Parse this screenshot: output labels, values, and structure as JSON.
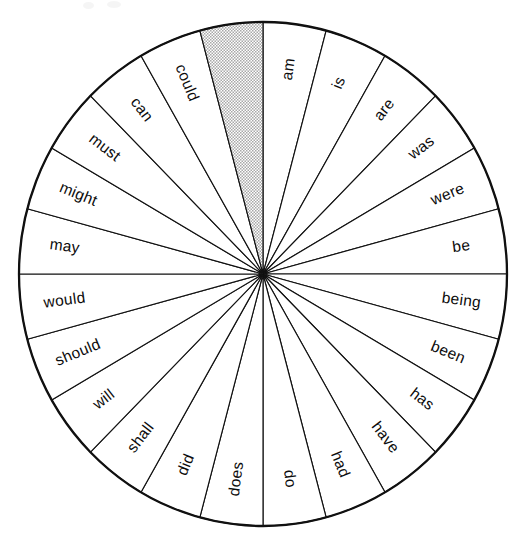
{
  "figure": {
    "type": "radial-sector-wheel",
    "sector_count": 24,
    "sector_degrees": 15,
    "center": {
      "x": 263,
      "y": 274
    },
    "radius_x": 244,
    "radius_y": 252,
    "colors": {
      "outline": "#101010",
      "sector_fill": "#ffffff",
      "shaded_fill": "#cfcfcf",
      "background": "#ffffff",
      "text": "#0c0c0c"
    },
    "label_radius_fraction": 0.82
  },
  "chart_data": {
    "type": "pie",
    "xlabel": "",
    "ylabel": "",
    "legend_position": "none",
    "grid": false,
    "equal_slices": true,
    "slice_degrees": 15,
    "start_angle_deg": -90,
    "direction": "clockwise",
    "categories": [
      "am",
      "is",
      "are",
      "was",
      "were",
      "be",
      "being",
      "been",
      "has",
      "have",
      "had",
      "do",
      "does",
      "did",
      "shall",
      "will",
      "should",
      "would",
      "may",
      "might",
      "must",
      "can",
      "could",
      ""
    ],
    "values": [
      15,
      15,
      15,
      15,
      15,
      15,
      15,
      15,
      15,
      15,
      15,
      15,
      15,
      15,
      15,
      15,
      15,
      15,
      15,
      15,
      15,
      15,
      15,
      15
    ],
    "shaded_indices": [
      23
    ],
    "annotations": [
      "One sector is left blank and shaded gray, immediately counter-clockwise of the 12 o'clock position."
    ]
  },
  "wheel": {
    "sectors": [
      {
        "index": 0,
        "label": "am",
        "start_deg": -90,
        "end_deg": -75,
        "shaded": false
      },
      {
        "index": 1,
        "label": "is",
        "start_deg": -75,
        "end_deg": -60,
        "shaded": false
      },
      {
        "index": 2,
        "label": "are",
        "start_deg": -60,
        "end_deg": -45,
        "shaded": false
      },
      {
        "index": 3,
        "label": "was",
        "start_deg": -45,
        "end_deg": -30,
        "shaded": false
      },
      {
        "index": 4,
        "label": "were",
        "start_deg": -30,
        "end_deg": -15,
        "shaded": false
      },
      {
        "index": 5,
        "label": "be",
        "start_deg": -15,
        "end_deg": 0,
        "shaded": false
      },
      {
        "index": 6,
        "label": "being",
        "start_deg": 0,
        "end_deg": 15,
        "shaded": false
      },
      {
        "index": 7,
        "label": "been",
        "start_deg": 15,
        "end_deg": 30,
        "shaded": false
      },
      {
        "index": 8,
        "label": "has",
        "start_deg": 30,
        "end_deg": 45,
        "shaded": false
      },
      {
        "index": 9,
        "label": "have",
        "start_deg": 45,
        "end_deg": 60,
        "shaded": false
      },
      {
        "index": 10,
        "label": "had",
        "start_deg": 60,
        "end_deg": 75,
        "shaded": false
      },
      {
        "index": 11,
        "label": "do",
        "start_deg": 75,
        "end_deg": 90,
        "shaded": false
      },
      {
        "index": 12,
        "label": "does",
        "start_deg": 90,
        "end_deg": 105,
        "shaded": false
      },
      {
        "index": 13,
        "label": "did",
        "start_deg": 105,
        "end_deg": 120,
        "shaded": false
      },
      {
        "index": 14,
        "label": "shall",
        "start_deg": 120,
        "end_deg": 135,
        "shaded": false
      },
      {
        "index": 15,
        "label": "will",
        "start_deg": 135,
        "end_deg": 150,
        "shaded": false
      },
      {
        "index": 16,
        "label": "should",
        "start_deg": 150,
        "end_deg": 165,
        "shaded": false
      },
      {
        "index": 17,
        "label": "would",
        "start_deg": 165,
        "end_deg": 180,
        "shaded": false
      },
      {
        "index": 18,
        "label": "may",
        "start_deg": 180,
        "end_deg": 195,
        "shaded": false
      },
      {
        "index": 19,
        "label": "might",
        "start_deg": 195,
        "end_deg": 210,
        "shaded": false
      },
      {
        "index": 20,
        "label": "must",
        "start_deg": 210,
        "end_deg": 225,
        "shaded": false
      },
      {
        "index": 21,
        "label": "can",
        "start_deg": 225,
        "end_deg": 240,
        "shaded": false
      },
      {
        "index": 22,
        "label": "could",
        "start_deg": 240,
        "end_deg": 255,
        "shaded": false
      },
      {
        "index": 23,
        "label": "",
        "start_deg": 255,
        "end_deg": 270,
        "shaded": true
      }
    ]
  }
}
